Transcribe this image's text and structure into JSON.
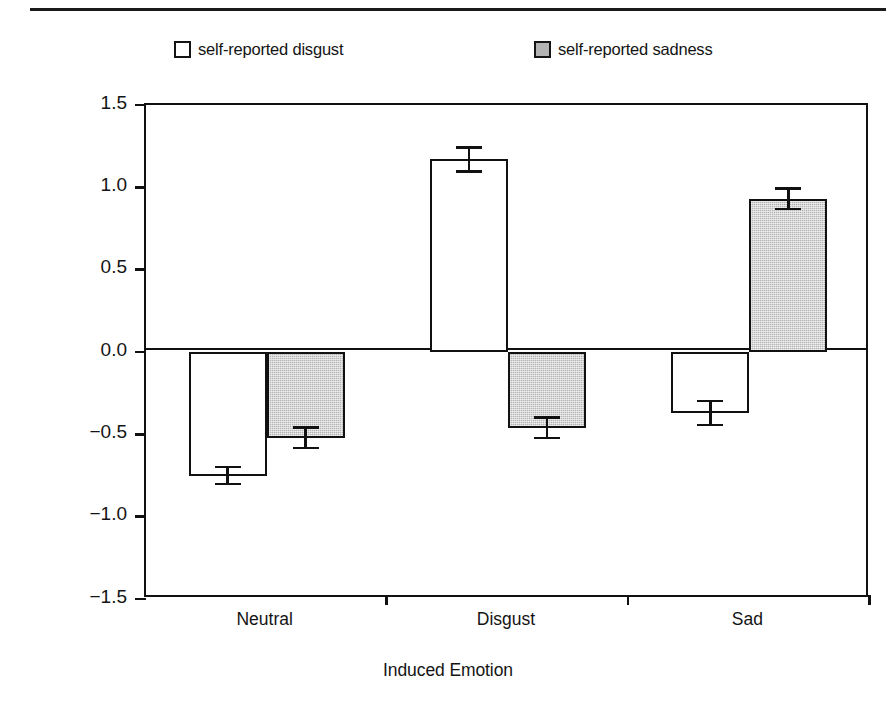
{
  "legend": {
    "entries": [
      {
        "label": "self-reported disgust",
        "swatch": "white"
      },
      {
        "label": "self-reported sadness",
        "swatch": "gray"
      }
    ]
  },
  "chart_data": {
    "type": "bar",
    "title": "",
    "xlabel": "Induced Emotion",
    "ylabel": "Z-score of Self-Reported Emotion",
    "categories": [
      "Neutral",
      "Disgust",
      "Sad"
    ],
    "ylim": [
      -1.5,
      1.5
    ],
    "yticks": [
      "1.5",
      "1.0",
      "0.5",
      "0.0",
      "-0.5",
      "-1.0",
      "-1.5"
    ],
    "ytick_values": [
      1.5,
      1.0,
      0.5,
      0.0,
      -0.5,
      -1.0,
      -1.5
    ],
    "grid": false,
    "legend_position": "top",
    "series": [
      {
        "name": "self-reported disgust",
        "fill": "white",
        "values": [
          -0.75,
          1.17,
          -0.37
        ],
        "errors": [
          0.06,
          0.08,
          0.08
        ]
      },
      {
        "name": "self-reported sadness",
        "fill": "gray",
        "values": [
          -0.52,
          -0.46,
          0.93
        ],
        "errors": [
          0.07,
          0.07,
          0.07
        ]
      }
    ]
  },
  "colors": {
    "ink": "#111111",
    "bar_gray": "#b5b5b5",
    "bar_white": "#ffffff"
  }
}
